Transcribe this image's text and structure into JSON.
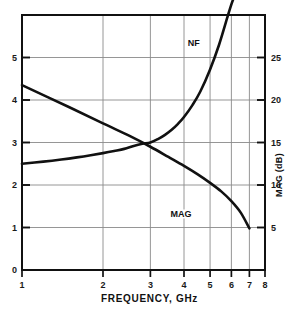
{
  "chart_data": {
    "type": "line",
    "title": "",
    "xlabel": "FREQUENCY, GHz",
    "ylabel": "",
    "ylabel_right": "MAG (dB)",
    "xscale": "log",
    "xlim": [
      1,
      8
    ],
    "ylim": [
      0,
      6
    ],
    "ylim_right": [
      0,
      30
    ],
    "grid": true,
    "legend_position": "inline-annotations",
    "xticks": [
      1,
      2,
      3,
      4,
      5,
      6,
      7,
      8
    ],
    "xtick_labels": [
      "1",
      "2",
      "3",
      "4",
      "5",
      "6",
      "7",
      "8"
    ],
    "yticks_left": [
      0,
      1,
      2,
      3,
      4,
      5,
      6
    ],
    "ytick_labels_left": [
      "0",
      "1",
      "2",
      "3",
      "4",
      "5",
      ""
    ],
    "yticks_right": [
      0,
      5,
      10,
      15,
      20,
      25,
      30
    ],
    "ytick_labels_right": [
      "",
      "5",
      "10",
      "15",
      "20",
      "25",
      ""
    ],
    "series": [
      {
        "name": "NF",
        "axis": "left",
        "units": "dB",
        "annotation": "NF",
        "annotation_x": 4.35,
        "annotation_y": 5.35,
        "x": [
          1.0,
          1.2,
          1.4,
          1.6,
          1.8,
          2.0,
          2.2,
          2.4,
          2.6,
          2.8,
          3.0,
          3.2,
          3.4,
          3.6,
          3.8,
          4.0,
          4.3,
          4.6,
          5.0,
          5.4,
          5.8,
          6.0,
          6.2,
          6.3
        ],
        "y": [
          2.5,
          2.55,
          2.6,
          2.65,
          2.7,
          2.75,
          2.8,
          2.85,
          2.92,
          2.97,
          3.0,
          3.08,
          3.18,
          3.3,
          3.44,
          3.6,
          3.88,
          4.2,
          4.72,
          5.3,
          5.95,
          6.25,
          6.5,
          6.65
        ]
      },
      {
        "name": "MAG",
        "axis": "right",
        "units": "dB",
        "annotation": "MAG",
        "annotation_x": 3.9,
        "annotation_y": 1.33,
        "x": [
          1.0,
          1.5,
          2.0,
          2.5,
          3.0,
          3.5,
          4.0,
          4.5,
          5.0,
          5.5,
          6.0,
          6.5,
          7.0
        ],
        "y_left_equiv": [
          4.35,
          3.83,
          3.45,
          3.16,
          2.9,
          2.66,
          2.45,
          2.25,
          2.05,
          1.85,
          1.62,
          1.35,
          0.98
        ],
        "y": [
          21.75,
          19.15,
          17.25,
          15.8,
          14.5,
          13.3,
          12.25,
          11.25,
          10.25,
          9.25,
          8.1,
          6.75,
          4.9
        ]
      }
    ]
  },
  "figure": {
    "background_color": "#ffffff",
    "line_color": "#111111",
    "grid_color": "#8a8a8a",
    "axis_color": "#111111"
  }
}
